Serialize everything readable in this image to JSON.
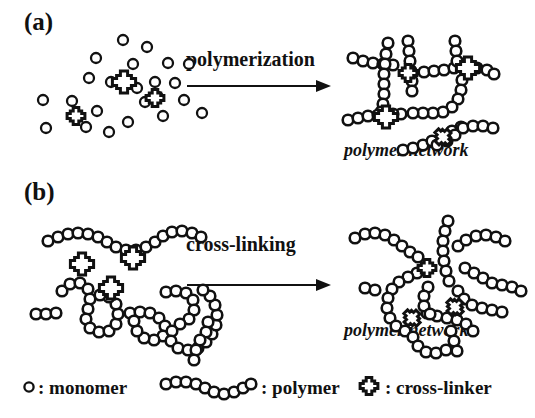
{
  "figure": {
    "background_color": "#ffffff",
    "ink_color": "#111111"
  },
  "panels": [
    {
      "id": "a",
      "label": "(a)",
      "reactant_description": "dispersed monomers and cross-linkers",
      "arrow_label": "polymerization",
      "product_caption": "polymer network"
    },
    {
      "id": "b",
      "label": "(b)",
      "reactant_description": "pre-formed polymer chains and free cross-linkers",
      "arrow_label": "cross-linking",
      "product_caption": "polymer network"
    }
  ],
  "legend": {
    "items": [
      {
        "symbol": "circle-icon",
        "separator": ":",
        "label": "monomer",
        "text": ": monomer"
      },
      {
        "symbol": "bead-chain-icon",
        "separator": ":",
        "label": "polymer",
        "text": ": polymer"
      },
      {
        "symbol": "cross-icon",
        "separator": ":",
        "label": "cross-linker",
        "text": ": cross-linker"
      }
    ]
  },
  "counts": {
    "panel_a_monomers": 23,
    "panel_a_crosslinkers": 3,
    "panel_b_chains": 5,
    "panel_b_crosslinkers": 3
  }
}
